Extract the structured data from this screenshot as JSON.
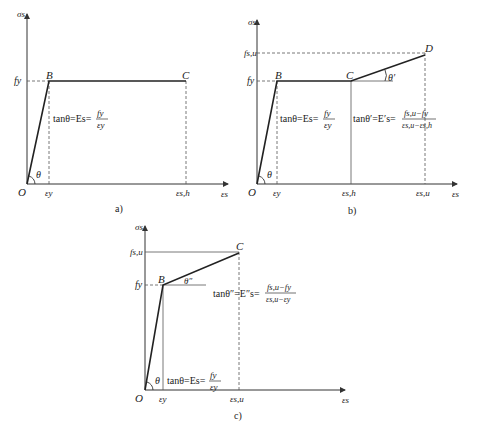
{
  "panels": [
    {
      "id": "a",
      "caption": "a)",
      "y_axis_label": "σs",
      "x_axis_label": "εs",
      "origin_label": "O",
      "y_ticks": [
        "fy"
      ],
      "x_ticks": [
        "εy",
        "εs,h"
      ],
      "points": [
        "B",
        "C"
      ],
      "angle_label": "θ",
      "formula": "tanθ=Es=fy/εy",
      "formula_lhs": "tanθ=Es=",
      "formula_num": "fy",
      "formula_den": "εy"
    },
    {
      "id": "b",
      "caption": "b)",
      "y_axis_label": "σs",
      "x_axis_label": "εs",
      "origin_label": "O",
      "y_ticks": [
        "fs,u",
        "fy"
      ],
      "x_ticks": [
        "εy",
        "εs,h",
        "εs,u"
      ],
      "points": [
        "B",
        "C",
        "D"
      ],
      "angle_labels": [
        "θ",
        "θ′"
      ],
      "formula1_lhs": "tanθ=Es=",
      "formula1_num": "fy",
      "formula1_den": "εy",
      "formula2_lhs": "tanθ′=E′s=",
      "formula2_num": "fs,u−fy",
      "formula2_den": "εs,u−εs,h"
    },
    {
      "id": "c",
      "caption": "c)",
      "y_axis_label": "σs",
      "x_axis_label": "εs",
      "origin_label": "O",
      "y_ticks": [
        "fs,u",
        "fy"
      ],
      "x_ticks": [
        "εy",
        "εs,u"
      ],
      "points": [
        "B",
        "C"
      ],
      "angle_labels": [
        "θ",
        "θ″"
      ],
      "formula1_lhs": "tanθ″=E″s=",
      "formula1_num": "fs,u−fy",
      "formula1_den": "εs,u−εy",
      "formula2_lhs": "tanθ=Es=",
      "formula2_num": "fy",
      "formula2_den": "εy"
    }
  ]
}
